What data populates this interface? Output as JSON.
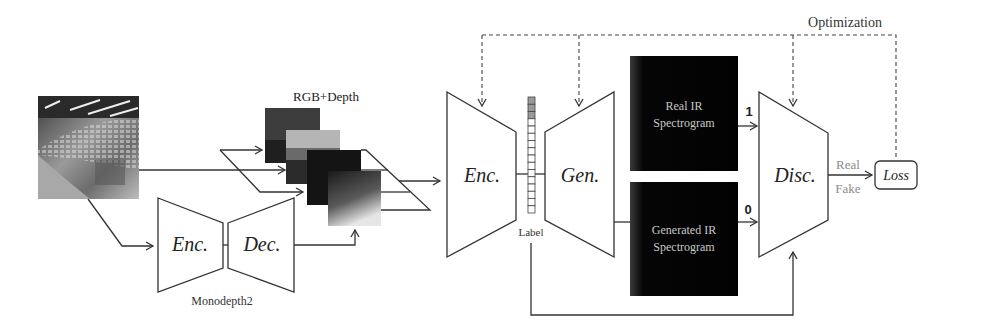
{
  "diagram": {
    "top_label": "Optimization",
    "input_photo": {
      "description": "grayscale photo of lecture hall seating"
    },
    "monodepth": {
      "encoder_label": "Enc.",
      "decoder_label": "Dec.",
      "caption": "Monodepth2"
    },
    "stack": {
      "label": "RGB+Depth"
    },
    "encoder": {
      "label": "Enc."
    },
    "latent": {
      "label": "Label",
      "cells": 16
    },
    "generator": {
      "label": "Gen."
    },
    "real_box": {
      "line1": "Real IR",
      "line2": "Spectrogram",
      "target": "1"
    },
    "generated_box": {
      "line1": "Generated IR",
      "line2": "Spectrogram",
      "target": "0"
    },
    "discriminator": {
      "label": "Disc."
    },
    "outputs": {
      "real": "Real",
      "fake": "Fake"
    },
    "loss": {
      "label": "Loss"
    },
    "colors": {
      "line": "#333333",
      "box_fill": "#050505",
      "box_text": "#c8c8c8",
      "muted_text": "#8a8a8a"
    }
  }
}
